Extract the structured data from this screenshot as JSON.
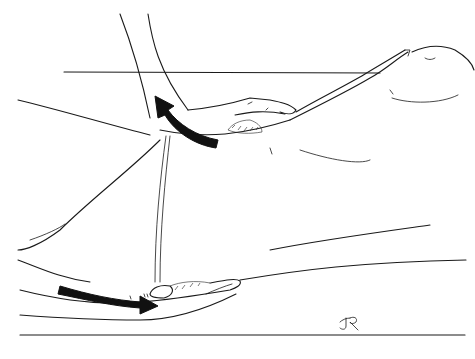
{
  "illustration": {
    "description": "Line drawing of a massage technique: one hand placed under the upper body near the armpit and another hand cupped under the lower back/hip, with curved black arrows indicating motion direction",
    "style": "black ink line art on white",
    "colors": {
      "ink": "#1a1a1a",
      "arrow_fill": "#111111",
      "background": "#ffffff"
    },
    "arrows": [
      {
        "name": "upper-curved-arrow",
        "direction": "up-left curving from lower-right"
      },
      {
        "name": "lower-straight-arrow",
        "direction": "left-to-right"
      }
    ],
    "signature": "JR"
  }
}
